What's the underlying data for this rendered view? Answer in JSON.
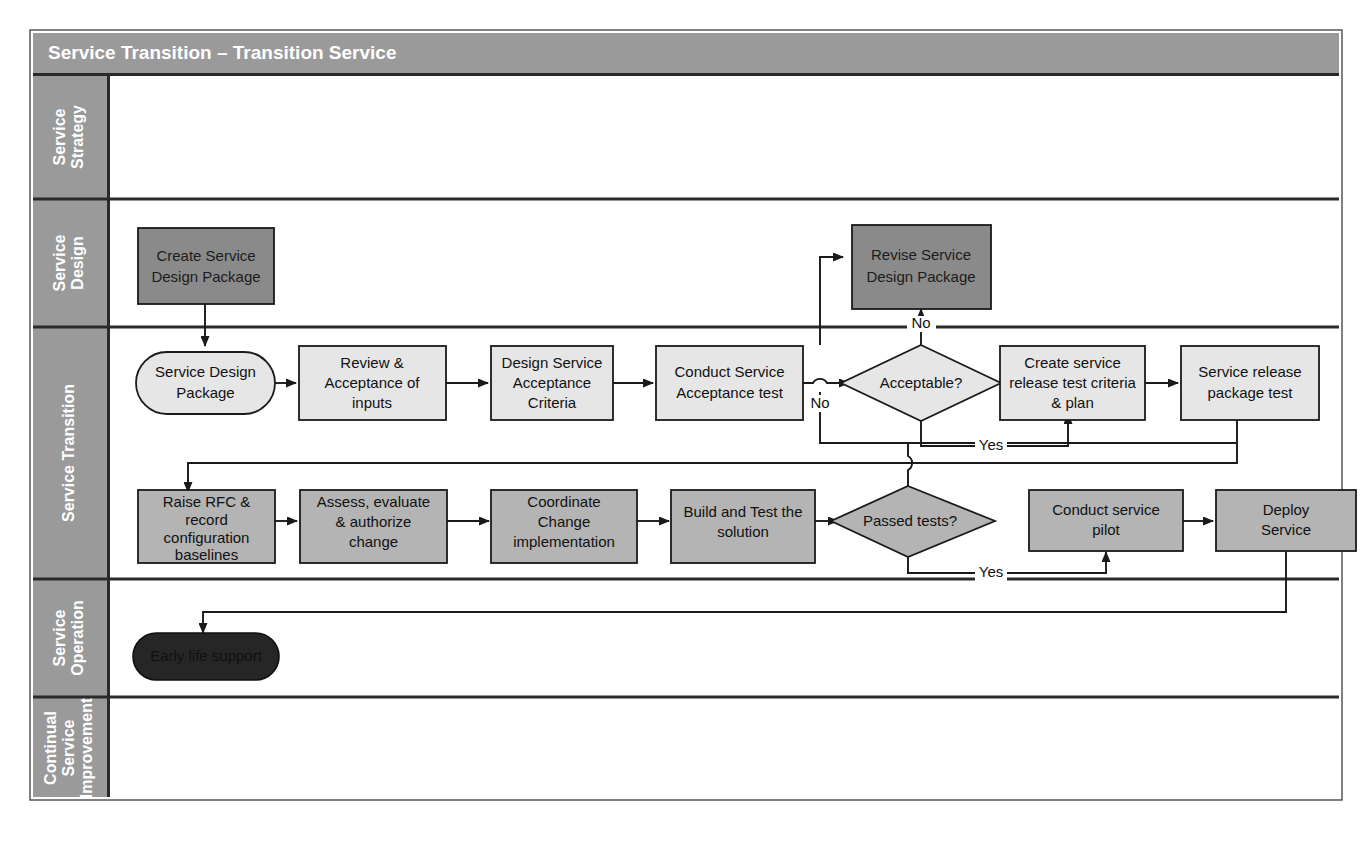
{
  "title": "Service Transition – Transition Service",
  "colors": {
    "lane_header_bg": "#9a9a9a",
    "title_bg": "#9a9a9a",
    "light_box": "#e6e6e6",
    "mid_box": "#b4b4b4",
    "dark_box": "#8a8a8a",
    "black_box": "#262626",
    "stroke": "#1a1a1a",
    "canvas": "#ffffff"
  },
  "lanes": [
    {
      "id": "service-strategy",
      "label": "Service Strategy"
    },
    {
      "id": "service-design",
      "label": "Service Design"
    },
    {
      "id": "service-transition",
      "label": "Service Transition"
    },
    {
      "id": "service-operation",
      "label": "Service Operation"
    },
    {
      "id": "continual-service-improvement",
      "label": "Continual Service Improvement"
    }
  ],
  "nodes": [
    {
      "id": "create-service-design-package",
      "lane": "service-design",
      "shape": "rect",
      "fill": "dark",
      "lines": [
        "Create Service",
        "Design Package"
      ]
    },
    {
      "id": "revise-service-design-package",
      "lane": "service-design",
      "shape": "rect",
      "fill": "dark",
      "lines": [
        "Revise Service",
        "Design Package"
      ]
    },
    {
      "id": "service-design-package",
      "lane": "service-transition",
      "shape": "stadium",
      "fill": "light",
      "lines": [
        "Service Design",
        "Package"
      ]
    },
    {
      "id": "review-acceptance-of-inputs",
      "lane": "service-transition",
      "shape": "rect",
      "fill": "light",
      "lines": [
        "Review &",
        "Acceptance of",
        "inputs"
      ]
    },
    {
      "id": "design-service-acceptance-criteria",
      "lane": "service-transition",
      "shape": "rect",
      "fill": "light",
      "lines": [
        "Design Service",
        "Acceptance",
        "Criteria"
      ]
    },
    {
      "id": "conduct-service-acceptance-test",
      "lane": "service-transition",
      "shape": "rect",
      "fill": "light",
      "lines": [
        "Conduct Service",
        "Acceptance test"
      ]
    },
    {
      "id": "acceptable-decision",
      "lane": "service-transition",
      "shape": "diamond",
      "fill": "light",
      "lines": [
        "Acceptable?"
      ]
    },
    {
      "id": "create-service-release-test-criteria-plan",
      "lane": "service-transition",
      "shape": "rect",
      "fill": "light",
      "lines": [
        "Create service",
        "release test criteria",
        "& plan"
      ]
    },
    {
      "id": "service-release-package-test",
      "lane": "service-transition",
      "shape": "rect",
      "fill": "light",
      "lines": [
        "Service release",
        "package test"
      ]
    },
    {
      "id": "raise-rfc-record-configuration-baselines",
      "lane": "service-transition",
      "shape": "rect",
      "fill": "mid",
      "lines": [
        "Raise RFC &",
        "record",
        "configuration",
        "baselines"
      ]
    },
    {
      "id": "assess-evaluate-authorize-change",
      "lane": "service-transition",
      "shape": "rect",
      "fill": "mid",
      "lines": [
        "Assess, evaluate",
        "& authorize",
        "change"
      ]
    },
    {
      "id": "coordinate-change-implementation",
      "lane": "service-transition",
      "shape": "rect",
      "fill": "mid",
      "lines": [
        "Coordinate",
        "Change",
        "implementation"
      ]
    },
    {
      "id": "build-and-test-the-solution",
      "lane": "service-transition",
      "shape": "rect",
      "fill": "mid",
      "lines": [
        "Build and Test the",
        "solution"
      ]
    },
    {
      "id": "passed-tests-decision",
      "lane": "service-transition",
      "shape": "diamond",
      "fill": "mid",
      "lines": [
        "Passed tests?"
      ]
    },
    {
      "id": "conduct-service-pilot",
      "lane": "service-transition",
      "shape": "rect",
      "fill": "mid",
      "lines": [
        "Conduct service",
        "pilot"
      ]
    },
    {
      "id": "deploy-service",
      "lane": "service-transition",
      "shape": "rect",
      "fill": "mid",
      "lines": [
        "Deploy",
        "Service"
      ]
    },
    {
      "id": "early-life-support",
      "lane": "service-operation",
      "shape": "stadium",
      "fill": "black",
      "lines": [
        "Early life support"
      ]
    }
  ],
  "edge_labels": [
    {
      "id": "acceptable-no-up",
      "text": "No"
    },
    {
      "id": "acceptable-no-down",
      "text": "No"
    },
    {
      "id": "acceptable-yes",
      "text": "Yes"
    },
    {
      "id": "passed-tests-yes",
      "text": "Yes"
    }
  ]
}
